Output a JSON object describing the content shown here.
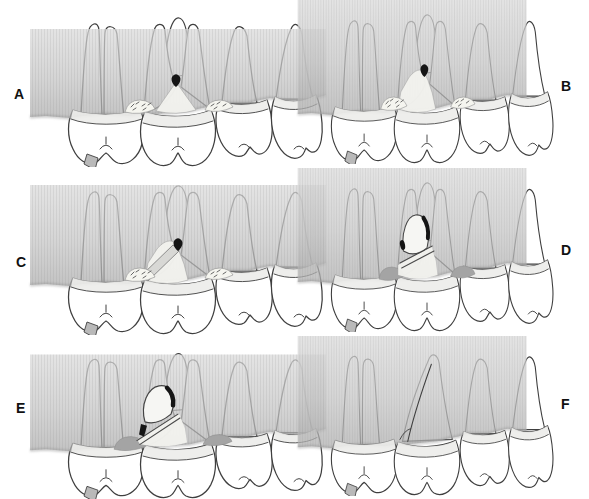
{
  "figure_type": "dental-illustration-sequence",
  "panels": [
    {
      "label": "A",
      "label_side": "left",
      "features": [
        "furcation-lesion-dot",
        "early-furcation-defect",
        "calculus-deposits"
      ]
    },
    {
      "label": "B",
      "label_side": "right",
      "features": [
        "furcation-lesion-dot",
        "advanced-furcation-defect",
        "calculus-deposits"
      ]
    },
    {
      "label": "C",
      "label_side": "left",
      "features": [
        "furcation-lesion-dot",
        "advanced-furcation-defect",
        "calculus-deposits",
        "root-resection-line"
      ]
    },
    {
      "label": "D",
      "label_side": "right",
      "features": [
        "resected-root-stump",
        "sealed-canal-black",
        "root-cut-gap",
        "granulation-tissue"
      ]
    },
    {
      "label": "E",
      "label_side": "left",
      "features": [
        "resected-root-stump-elevated",
        "sealed-canal-black",
        "root-cut-gap",
        "granulation-tissue"
      ]
    },
    {
      "label": "F",
      "label_side": "right",
      "features": [
        "healed-site",
        "root-removed-contour"
      ]
    }
  ],
  "colors": {
    "background": "#ffffff",
    "tooth_fill": "#ffffff",
    "tooth_outline": "#3f3f3f",
    "tissue_band_top": "#dadada",
    "tissue_band_mid": "#c6c6c6",
    "tissue_band_bottom": "#aeaeae",
    "tissue_edge_shadow": "#8f8f8f",
    "enamel_collar": "#ececea",
    "defect_light": "#f2f2ee",
    "calculus_fill": "#f5f5ef",
    "calculus_dash": "#555555",
    "lesion_black": "#151515",
    "granulation_gray": "#a4a4a4",
    "resection_rod": "#d8d8d5",
    "cusp_wedge": "#b9b9b9",
    "label_color": "#111111"
  }
}
